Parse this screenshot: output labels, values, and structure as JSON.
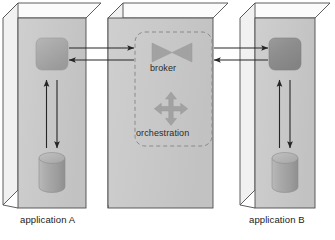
{
  "diagram": {
    "type": "architecture-diagram",
    "background_color": "#ffffff",
    "panels": [
      {
        "id": "application-a",
        "caption": "application A",
        "face_color": "#c9c9c9",
        "top_color": "#fcfcfc",
        "side_color": "#f2f2f2",
        "outline_color": "#4a4a4a",
        "components": [
          {
            "name": "app-module",
            "shape": "rounded-square",
            "color": "#a8a8a8",
            "label": ""
          },
          {
            "name": "database",
            "shape": "cylinder",
            "color": "#a8a8a8",
            "label": ""
          }
        ]
      },
      {
        "id": "middleware",
        "caption": "",
        "face_color": "#c9c9c9",
        "top_color": "#fcfcfc",
        "side_color": "#f2f2f2",
        "outline_color": "#4a4a4a",
        "dashed_group_label": "",
        "components": [
          {
            "name": "broker",
            "shape": "bowtie",
            "color": "#a0a0a0",
            "label": "broker"
          },
          {
            "name": "orchestration",
            "shape": "four-way-arrow",
            "color": "#a0a0a0",
            "label": "orchestration"
          }
        ]
      },
      {
        "id": "application-b",
        "caption": "application B",
        "face_color": "#c9c9c9",
        "top_color": "#fcfcfc",
        "side_color": "#f2f2f2",
        "outline_color": "#4a4a4a",
        "components": [
          {
            "name": "app-module",
            "shape": "rounded-square",
            "color": "#8f8f8f",
            "label": ""
          },
          {
            "name": "database",
            "shape": "cylinder",
            "color": "#a8a8a8",
            "label": ""
          }
        ]
      }
    ],
    "connectors": [
      {
        "name": "a-to-broker",
        "direction": "right",
        "from": "application-a.app-module",
        "to": "middleware"
      },
      {
        "name": "broker-to-a",
        "direction": "left",
        "from": "middleware",
        "to": "application-a.app-module"
      },
      {
        "name": "broker-to-b",
        "direction": "right",
        "from": "middleware",
        "to": "application-b.app-module"
      },
      {
        "name": "b-to-broker",
        "direction": "left",
        "from": "application-b.app-module",
        "to": "middleware"
      },
      {
        "name": "a-db-to-module",
        "direction": "up",
        "from": "application-a.database",
        "to": "application-a.app-module"
      },
      {
        "name": "a-module-to-db",
        "direction": "down",
        "from": "application-a.app-module",
        "to": "application-a.database"
      },
      {
        "name": "b-db-to-module",
        "direction": "up",
        "from": "application-b.database",
        "to": "application-b.app-module"
      },
      {
        "name": "b-module-to-db",
        "direction": "down",
        "from": "application-b.app-module",
        "to": "application-b.database"
      }
    ],
    "labels": {
      "application_a": "application A",
      "application_b": "application B",
      "broker": "broker",
      "orchestration": "orchestration"
    },
    "colors": {
      "box_face": "#c9c9c9",
      "box_top": "#fbfbfb",
      "box_side": "#f0f0f0",
      "outline": "#4d4d4d",
      "component_light": "#a9a9a9",
      "component_dark": "#8d8d8d",
      "icon_gray": "#9e9e9e",
      "dashed_border": "#8a8a8a",
      "arrow": "#2a2a2a",
      "text": "#1a1a1a"
    }
  }
}
